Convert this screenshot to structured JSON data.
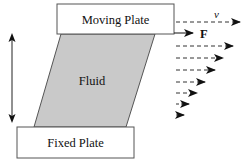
{
  "diagram": {
    "moving_plate": {
      "label": "Moving Plate"
    },
    "fixed_plate": {
      "label": "Fixed Plate"
    },
    "fluid": {
      "label": "Fluid",
      "fill": "#c9c9c9"
    },
    "velocity_label": "v",
    "force_label": "F",
    "colors": {
      "stroke": "#555555",
      "arrow": "#111111",
      "fluid": "#c9c9c9"
    },
    "velocity_profile": [
      {
        "y": 22,
        "tip_x": 241
      },
      {
        "y": 46,
        "tip_x": 234
      },
      {
        "y": 58,
        "tip_x": 224
      },
      {
        "y": 70,
        "tip_x": 216
      },
      {
        "y": 82,
        "tip_x": 206
      },
      {
        "y": 93,
        "tip_x": 198
      },
      {
        "y": 104,
        "tip_x": 190
      },
      {
        "y": 115,
        "tip_x": 185
      }
    ]
  }
}
